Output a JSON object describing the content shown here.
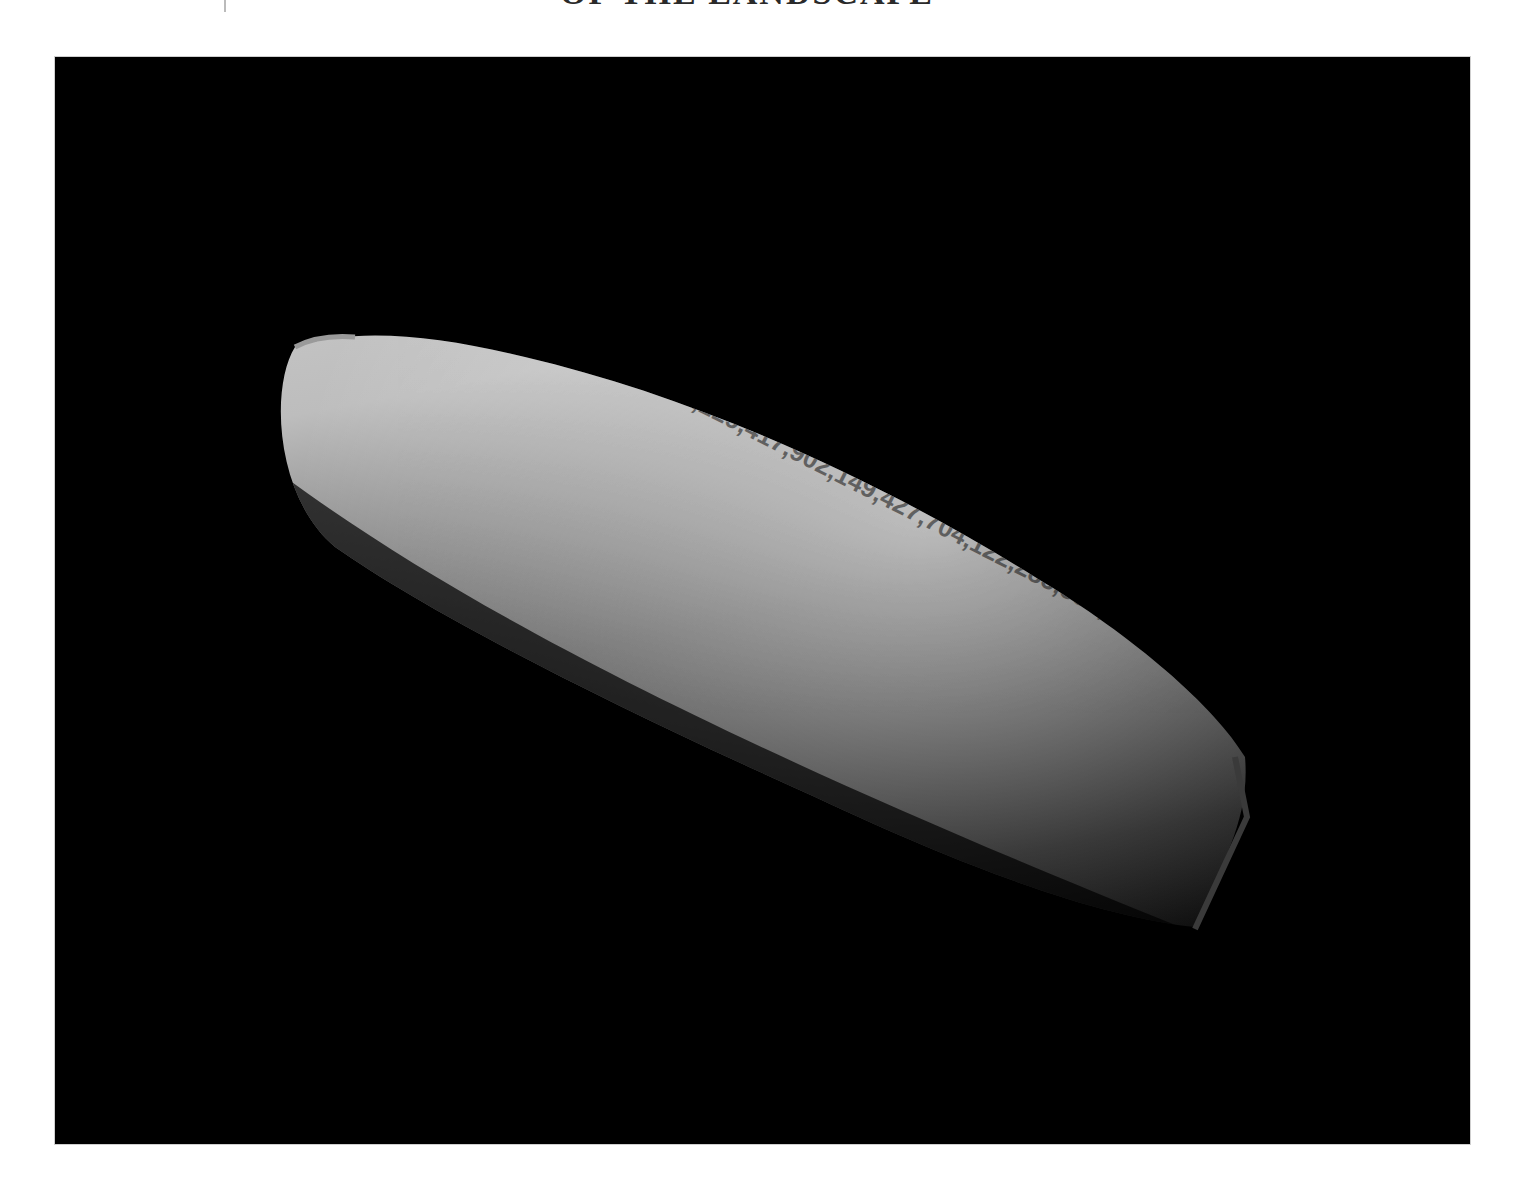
{
  "page": {
    "title_clipped": "OF THE LANDSCAPE",
    "background": "#ffffff"
  },
  "figure": {
    "panel_color": "#000000",
    "object": "spindle-shaped rendered surface textured with comma-separated numbers",
    "number_rows": [
      "6,94,70,92,62,57,26,93,62,89,50,97,64",
      "83,627,857,82,727,638,603,493,463,931,02,763,197,58,335,949,337,372,641,620,459,846",
      "4,865,1672,355,735,357,166,652,958,361,362,363,948,211,366,367,666,128,55,634,810,379,424",
      "99,96,94,666,306,550,389,959,245,391,392,70,788,951,687,353,398,98,633,134,589,988,77,543",
      "97,39,67,76,15,379,723,428,229,417,902,149,427,704,122,285,583,687,651,985,565"
    ]
  }
}
